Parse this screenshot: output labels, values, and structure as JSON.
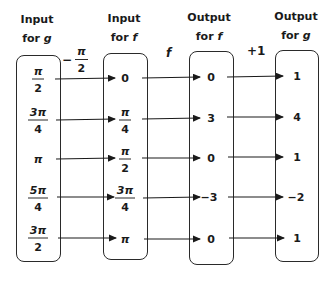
{
  "columns": [
    {
      "line1": "Input",
      "line2_prefix": "for ",
      "line2_var": "g"
    },
    {
      "line1": "Input",
      "line2_prefix": "for ",
      "line2_var": "f"
    },
    {
      "line1": "Output",
      "line2_prefix": "for ",
      "line2_var": "f"
    },
    {
      "line1": "Output",
      "line2_prefix": "for ",
      "line2_var": "g"
    }
  ],
  "operations": {
    "op1_sign": "−",
    "op1_num": "π",
    "op1_den": "2",
    "op2": "f",
    "op3": "+1"
  },
  "input_g": [
    {
      "num": "π",
      "den": "2"
    },
    {
      "num": "3π",
      "den": "4"
    },
    {
      "whole": "π"
    },
    {
      "num": "5π",
      "den": "4"
    },
    {
      "num": "3π",
      "den": "2"
    }
  ],
  "input_f": [
    {
      "whole": "0"
    },
    {
      "num": "π",
      "den": "4"
    },
    {
      "num": "π",
      "den": "2"
    },
    {
      "num": "3π",
      "den": "4"
    },
    {
      "whole": "π"
    }
  ],
  "output_f": [
    "0",
    "3",
    "0",
    "−3",
    "0"
  ],
  "output_g": [
    "1",
    "4",
    "1",
    "−2",
    "1"
  ]
}
